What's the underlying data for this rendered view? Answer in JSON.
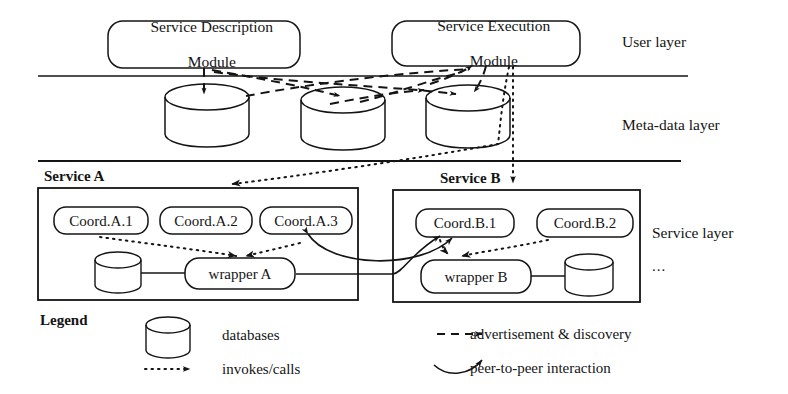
{
  "figure": {
    "ink_color": "#141414",
    "background": "#ffffff"
  },
  "layers": [
    {
      "id": "user",
      "label": "User layer"
    },
    {
      "id": "meta",
      "label": "Meta-data layer"
    },
    {
      "id": "service",
      "label": "Service layer"
    }
  ],
  "service_layer_more": "...",
  "modules": [
    {
      "id": "description",
      "line1": "Service Description",
      "line2": "Module"
    },
    {
      "id": "execution",
      "line1": "Service Execution",
      "line2": "Module"
    }
  ],
  "metadata_stores": [
    {
      "id": "meta-db-1",
      "label": ""
    },
    {
      "id": "meta-db-2",
      "label": ""
    },
    {
      "id": "meta-db-3",
      "label": ""
    }
  ],
  "services": [
    {
      "id": "service-a",
      "title": "Service A",
      "coordinators": [
        "Coord.A.1",
        "Coord.A.2",
        "Coord.A.3"
      ],
      "wrapper": "wrapper A",
      "database": ""
    },
    {
      "id": "service-b",
      "title": "Service B",
      "coordinators": [
        "Coord.B.1",
        "Coord.B.2"
      ],
      "wrapper": "wrapper B",
      "database": ""
    }
  ],
  "legend": {
    "title": "Legend",
    "items": [
      {
        "id": "databases",
        "symbol": "cylinder",
        "label": "databases"
      },
      {
        "id": "invokes",
        "symbol": "dotted-arrow",
        "label": "invokes/calls"
      },
      {
        "id": "advertisement",
        "symbol": "dashed-arrow",
        "label": "advertisement & discovery"
      },
      {
        "id": "peer",
        "symbol": "curved-arrow",
        "label": "peer-to-peer interaction"
      }
    ]
  }
}
